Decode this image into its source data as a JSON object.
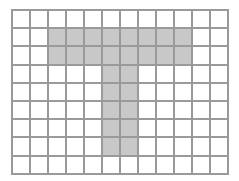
{
  "grid": {
    "columns": 12,
    "rows": 9,
    "line_color": "#9a9a9a",
    "fill_color": "#ffffff",
    "shade_color": "#c8c8c8",
    "shape": "T",
    "shaded_cells": [
      [
        1,
        2
      ],
      [
        1,
        3
      ],
      [
        1,
        4
      ],
      [
        1,
        5
      ],
      [
        1,
        6
      ],
      [
        1,
        7
      ],
      [
        1,
        8
      ],
      [
        1,
        9
      ],
      [
        2,
        2
      ],
      [
        2,
        3
      ],
      [
        2,
        4
      ],
      [
        2,
        5
      ],
      [
        2,
        6
      ],
      [
        2,
        7
      ],
      [
        2,
        8
      ],
      [
        2,
        9
      ],
      [
        3,
        5
      ],
      [
        3,
        6
      ],
      [
        4,
        5
      ],
      [
        4,
        6
      ],
      [
        5,
        5
      ],
      [
        5,
        6
      ],
      [
        6,
        5
      ],
      [
        6,
        6
      ],
      [
        7,
        5
      ],
      [
        7,
        6
      ]
    ]
  }
}
